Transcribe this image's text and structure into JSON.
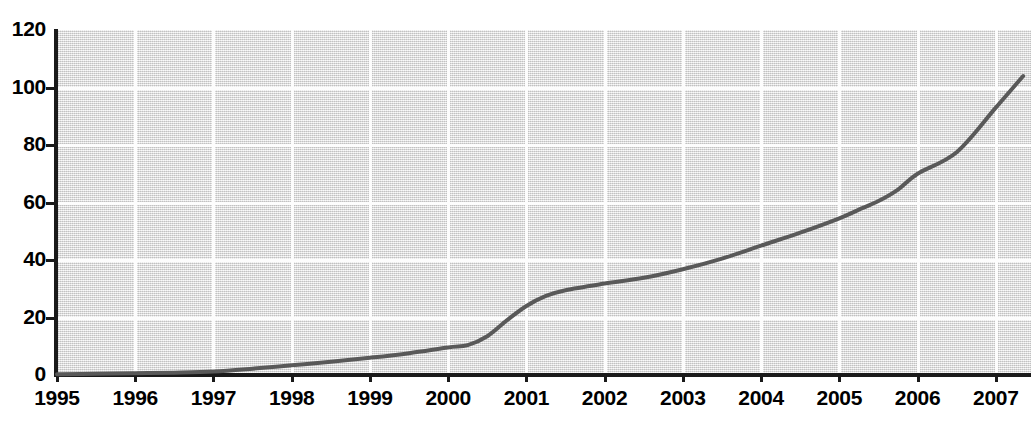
{
  "chart_data": {
    "type": "line",
    "title": "",
    "subtitle": "",
    "xlabel": "",
    "ylabel": "",
    "xlim": [
      1995,
      2007.45
    ],
    "ylim": [
      0,
      120
    ],
    "grid": true,
    "legend": null,
    "legend_position": "none",
    "y_ticks": [
      0,
      20,
      40,
      60,
      80,
      100,
      120
    ],
    "y_tick_labels": [
      "0",
      "20",
      "40",
      "60",
      "80",
      "100",
      "120"
    ],
    "x_ticks": [
      1995,
      1996,
      1997,
      1998,
      1999,
      2000,
      2001,
      2002,
      2003,
      2004,
      2005,
      2006,
      2007
    ],
    "x_tick_labels": [
      "1995",
      "1996",
      "1997",
      "1998",
      "1999",
      "2000",
      "2001",
      "2002",
      "2003",
      "2004",
      "2005",
      "2006",
      "2007"
    ],
    "series": [
      {
        "name": "cumulative",
        "color": "#595959",
        "line_width": 4,
        "x": [
          1995.0,
          1995.5,
          1996.0,
          1996.5,
          1997.0,
          1997.5,
          1998.0,
          1998.5,
          1999.0,
          1999.5,
          2000.0,
          2000.25,
          2000.5,
          2000.75,
          2001.0,
          2001.25,
          2001.5,
          2002.0,
          2002.5,
          2003.0,
          2003.5,
          2004.0,
          2004.5,
          2005.0,
          2005.25,
          2005.5,
          2005.75,
          2006.0,
          2006.5,
          2007.0,
          2007.35
        ],
        "y": [
          0.3,
          0.4,
          0.6,
          0.8,
          1.2,
          2.2,
          3.4,
          4.6,
          6.0,
          7.6,
          9.6,
          10.4,
          13.5,
          19.0,
          24.0,
          27.5,
          29.5,
          31.8,
          33.8,
          36.8,
          40.5,
          45.0,
          49.5,
          54.5,
          57.5,
          60.5,
          64.5,
          70.0,
          77.5,
          93.0,
          104.0
        ]
      }
    ],
    "annotations": []
  },
  "colors": {
    "plot_background": "#e2e2e2",
    "gridline": "#fdfdfd",
    "axis": "#1a1a1a",
    "series_line": "#595959",
    "page_background": "#ffffff"
  }
}
